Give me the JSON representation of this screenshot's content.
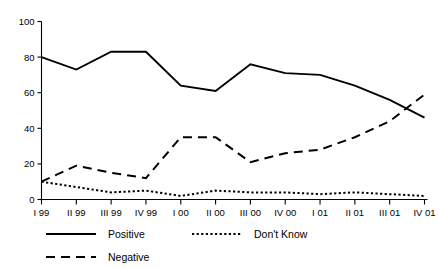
{
  "chart_data": {
    "type": "line",
    "title": "",
    "xlabel": "",
    "ylabel": "",
    "ylim": [
      0,
      100
    ],
    "yticks": [
      0,
      20,
      40,
      60,
      80,
      100
    ],
    "grid": false,
    "legend_position": "bottom",
    "categories": [
      "I 99",
      "II 99",
      "III 99",
      "IV 99",
      "I 00",
      "II 00",
      "III 00",
      "IV 00",
      "I 01",
      "II 01",
      "III 01",
      "IV 01"
    ],
    "series": [
      {
        "name": "Positive",
        "style": "solid",
        "color": "#000000",
        "values": [
          80,
          73,
          83,
          83,
          64,
          61,
          76,
          71,
          70,
          64,
          56,
          46
        ]
      },
      {
        "name": "Negative",
        "style": "dashed",
        "color": "#000000",
        "values": [
          10,
          19,
          15,
          12,
          35,
          35,
          21,
          26,
          28,
          35,
          44,
          59
        ]
      },
      {
        "name": "Don't Know",
        "style": "dotted",
        "color": "#000000",
        "values": [
          10,
          7,
          4,
          5,
          2,
          5,
          4,
          4,
          3,
          4,
          3,
          2
        ]
      }
    ]
  },
  "axis": {
    "y_tick_labels": [
      "0",
      "20",
      "40",
      "60",
      "80",
      "100"
    ],
    "x_tick_labels": [
      "I 99",
      "II 99",
      "III 99",
      "IV 99",
      "I 00",
      "II 00",
      "III 00",
      "IV 00",
      "I 01",
      "II 01",
      "III 01",
      "IV 01"
    ]
  },
  "legend": {
    "entries": [
      {
        "label": "Positive",
        "style": "solid"
      },
      {
        "label": "Don't Know",
        "style": "dotted"
      },
      {
        "label": "Negative",
        "style": "dashed"
      }
    ]
  }
}
